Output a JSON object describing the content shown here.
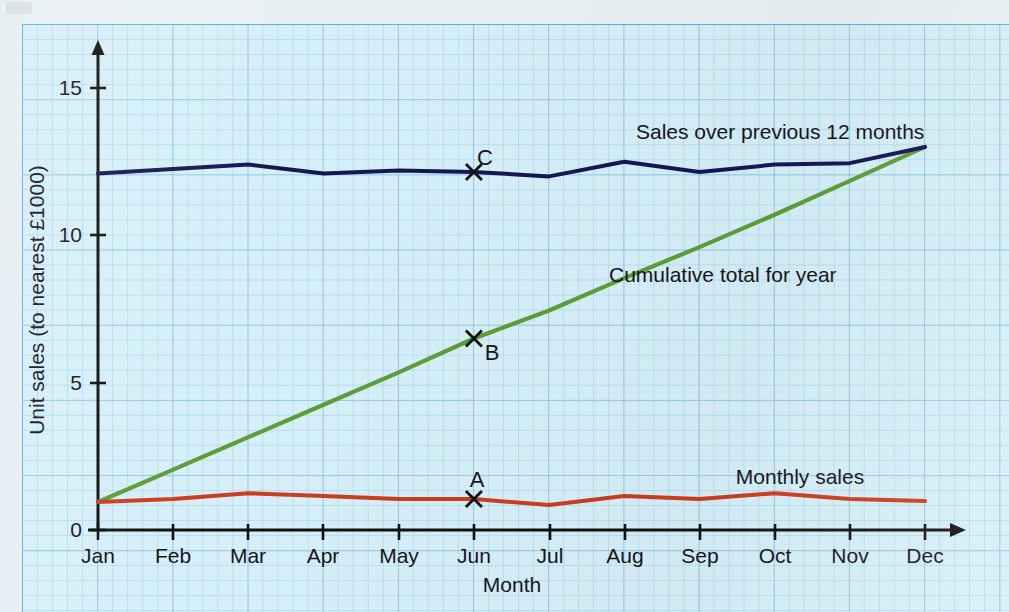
{
  "chart_data": {
    "type": "line",
    "title": "",
    "xlabel": "Month",
    "ylabel": "Unit sales (to nearest £1000)",
    "categories": [
      "Jan",
      "Feb",
      "Mar",
      "Apr",
      "May",
      "Jun",
      "Jul",
      "Aug",
      "Sep",
      "Oct",
      "Nov",
      "Dec"
    ],
    "xlim": [
      0,
      11
    ],
    "ylim": [
      0,
      16
    ],
    "yticks": [
      0,
      5,
      10,
      15
    ],
    "ytick_labels": [
      "0",
      "5",
      "10",
      "15"
    ],
    "grid": true,
    "legend": "inline-annotations",
    "series": [
      {
        "name": "Monthly sales",
        "color": "#cc3d1f",
        "label_text": "Monthly sales",
        "values": [
          0.95,
          1.05,
          1.25,
          1.15,
          1.05,
          1.05,
          0.85,
          1.15,
          1.05,
          1.25,
          1.05,
          0.98
        ]
      },
      {
        "name": "Cumulative total for year",
        "color": "#5d9e38",
        "label_text": "Cumulative total for year",
        "values": [
          0.95,
          2.05,
          3.15,
          4.25,
          5.35,
          6.5,
          7.45,
          8.55,
          9.6,
          10.7,
          11.85,
          13.0
        ]
      },
      {
        "name": "Sales over previous 12 months",
        "color": "#161653",
        "label_text": "Sales over previous 12 months",
        "values": [
          12.1,
          12.25,
          12.4,
          12.1,
          12.2,
          12.15,
          12.0,
          12.5,
          12.15,
          12.4,
          12.45,
          13.0
        ]
      }
    ],
    "annotations": [
      {
        "label": "A",
        "series": "Monthly sales",
        "month": "Jun",
        "value": 1.05,
        "marker": "x"
      },
      {
        "label": "B",
        "series": "Cumulative total for year",
        "month": "Jun",
        "value": 6.5,
        "marker": "x"
      },
      {
        "label": "C",
        "series": "Sales over previous 12 months",
        "month": "Jun",
        "value": 12.15,
        "marker": "x"
      }
    ]
  },
  "labels": {
    "y_axis_title": "Unit sales (to nearest £1000)",
    "x_axis_title": "Month",
    "series_top": "Sales over previous 12 months",
    "series_mid": "Cumulative total for year",
    "series_bottom": "Monthly sales",
    "point_a": "A",
    "point_b": "B",
    "point_c": "C",
    "ytick_0": "0",
    "ytick_5": "5",
    "ytick_10": "10",
    "ytick_15": "15",
    "month_jan": "Jan",
    "month_feb": "Feb",
    "month_mar": "Mar",
    "month_apr": "Apr",
    "month_may": "May",
    "month_jun": "Jun",
    "month_jul": "Jul",
    "month_aug": "Aug",
    "month_sep": "Sep",
    "month_oct": "Oct",
    "month_nov": "Nov",
    "month_dec": "Dec"
  },
  "colors": {
    "paper": "#d6eff8",
    "grid_minor": "#8cc8e1",
    "grid_major": "#78b9d7",
    "axis": "#111111",
    "monthly_sales": "#cc3d1f",
    "cumulative_total": "#5d9e38",
    "previous_12_months": "#161653"
  }
}
